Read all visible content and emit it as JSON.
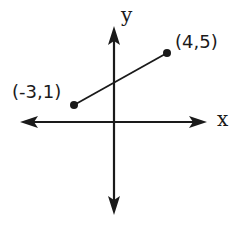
{
  "diagram": {
    "type": "coordinate-plane-segment",
    "axes": {
      "x_label": "x",
      "y_label": "y"
    },
    "points": [
      {
        "label": "(-3,1)",
        "x": -3,
        "y": 1
      },
      {
        "label": "(4,5)",
        "x": 4,
        "y": 5
      }
    ],
    "segment": {
      "from": "(-3,1)",
      "to": "(4,5)"
    },
    "colors": {
      "stroke": "#1a1a1a",
      "background": "#ffffff"
    }
  }
}
